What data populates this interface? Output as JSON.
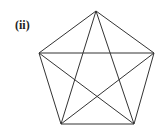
{
  "label": "(ii)",
  "figure": {
    "type": "complete-graph-K5",
    "vertices": [
      {
        "id": "top",
        "x": 96,
        "y": 11
      },
      {
        "id": "right",
        "x": 154,
        "y": 53
      },
      {
        "id": "bottom-right",
        "x": 134,
        "y": 124
      },
      {
        "id": "bottom-left",
        "x": 61,
        "y": 124
      },
      {
        "id": "left",
        "x": 39,
        "y": 53
      }
    ],
    "edges": [
      [
        "top",
        "right"
      ],
      [
        "right",
        "bottom-right"
      ],
      [
        "bottom-right",
        "bottom-left"
      ],
      [
        "bottom-left",
        "left"
      ],
      [
        "left",
        "top"
      ],
      [
        "top",
        "bottom-left"
      ],
      [
        "top",
        "bottom-right"
      ],
      [
        "left",
        "right"
      ],
      [
        "left",
        "bottom-right"
      ],
      [
        "right",
        "bottom-left"
      ]
    ],
    "stroke": "#333333"
  }
}
